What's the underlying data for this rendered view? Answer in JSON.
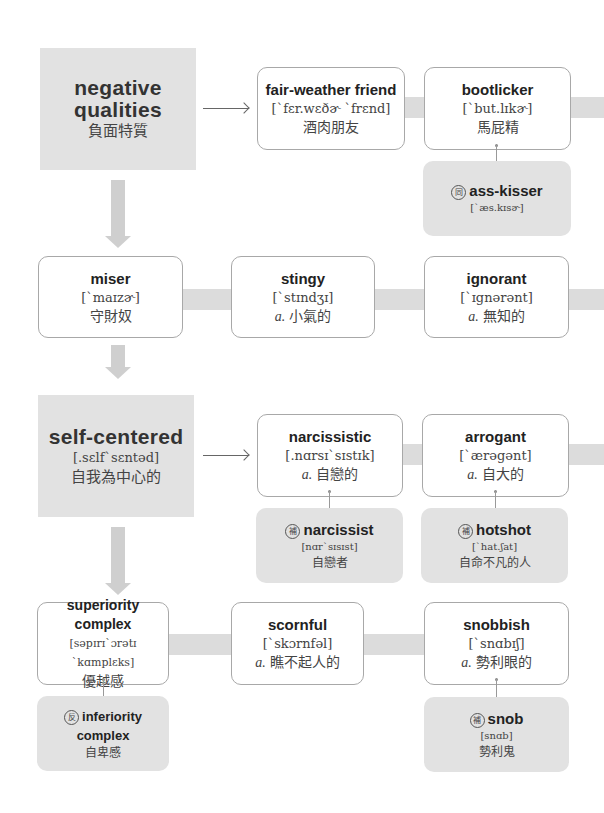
{
  "section1": {
    "header": {
      "word_line1": "negative",
      "word_line2": "qualities",
      "zh": "負面特質"
    },
    "cards": [
      {
        "word": "fair-weather friend",
        "ipa": "[ˋfɛr.wɛðɚ ˋfrɛnd]",
        "zh": "酒肉朋友"
      },
      {
        "word": "bootlicker",
        "ipa": "[ˋbut.lɪkɚ]",
        "zh": "馬屁精"
      }
    ],
    "subcards": [
      {
        "tag": "同",
        "word": "ass-kisser",
        "ipa": "[ˋæs.kɪsɚ]"
      }
    ]
  },
  "section2": {
    "cards": [
      {
        "word": "miser",
        "ipa": "[ˋmaɪzɚ]",
        "zh": "守財奴"
      },
      {
        "word": "stingy",
        "ipa": "[ˋstɪndʒɪ]",
        "pos": "a.",
        "zh": "小氣的"
      },
      {
        "word": "ignorant",
        "ipa": "[ˋɪgnərənt]",
        "pos": "a.",
        "zh": "無知的"
      }
    ]
  },
  "section3": {
    "header": {
      "word": "self-centered",
      "ipa": "[.sɛlfˋsɛntəd]",
      "zh": "自我為中心的"
    },
    "cards": [
      {
        "word": "narcissistic",
        "ipa": "[.nɑrsɪˋsɪstɪk]",
        "pos": "a.",
        "zh": "自戀的"
      },
      {
        "word": "arrogant",
        "ipa": "[ˋærəgənt]",
        "pos": "a.",
        "zh": "自大的"
      }
    ],
    "subcards": [
      {
        "tag": "補",
        "word": "narcissist",
        "ipa": "[nɑrˋsɪsɪst]",
        "zh": "自戀者"
      },
      {
        "tag": "補",
        "word": "hotshot",
        "ipa": "[ˋhat.ʃat]",
        "zh": "自命不凡的人"
      }
    ]
  },
  "section4": {
    "cards": [
      {
        "word": "superiority complex",
        "ipa": "[səpɪrɪˋɔrətɪ ˋkɑmplɛks]",
        "zh": "優越感"
      },
      {
        "word": "scornful",
        "ipa": "[ˋskɔrnfəl]",
        "pos": "a.",
        "zh": "瞧不起人的"
      },
      {
        "word": "snobbish",
        "ipa": "[ˋsnɑbɪʃ]",
        "pos": "a.",
        "zh": "勢利眼的"
      }
    ],
    "subcards": [
      {
        "tag": "反",
        "word": "inferiority complex",
        "zh": "自卑感"
      },
      {
        "tag": "補",
        "word": "snob",
        "ipa": "[snɑb]",
        "zh": "勢利鬼"
      }
    ]
  },
  "colors": {
    "panel_gray": "#e2e2e2",
    "connector_gray": "#dcdcdc",
    "arrow_gray": "#cfcfcf",
    "card_border": "#a8a8a8"
  }
}
